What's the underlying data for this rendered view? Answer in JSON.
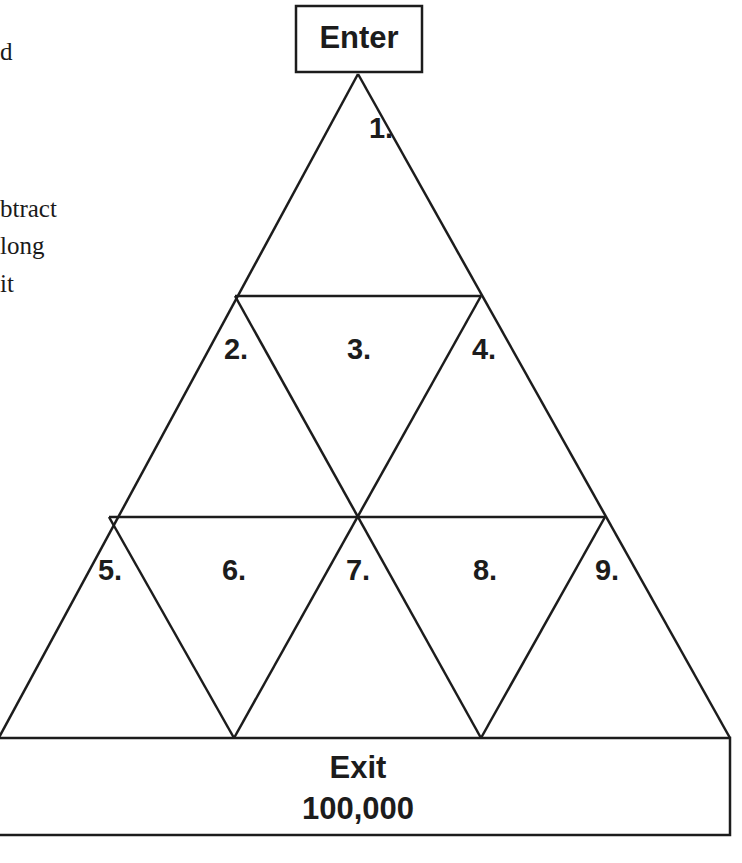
{
  "side_text": {
    "lines": [
      "d",
      "btract",
      "long",
      "it"
    ]
  },
  "diagram": {
    "enter_label": "Enter",
    "exit_label": "Exit",
    "exit_value": "100,000",
    "cells": [
      {
        "id": 1,
        "label": "1."
      },
      {
        "id": 2,
        "label": "2."
      },
      {
        "id": 3,
        "label": "3."
      },
      {
        "id": 4,
        "label": "4."
      },
      {
        "id": 5,
        "label": "5."
      },
      {
        "id": 6,
        "label": "6."
      },
      {
        "id": 7,
        "label": "7."
      },
      {
        "id": 8,
        "label": "8."
      },
      {
        "id": 9,
        "label": "9."
      }
    ],
    "line_color": "#1c1c1c"
  }
}
